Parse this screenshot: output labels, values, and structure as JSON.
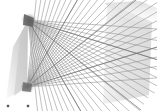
{
  "figure": {
    "kind": "line-art-geometric",
    "width": 157,
    "height": 111,
    "background_color": "#ffffff"
  },
  "chart_data": {
    "type": "scatter",
    "subtitle": "",
    "xlabel": "",
    "ylabel": "",
    "xlim": [
      0,
      157
    ],
    "ylim": [
      0,
      111
    ],
    "grid": false,
    "legend_position": "none",
    "tick_labels_x": [],
    "tick_labels_y": [],
    "annotations": [],
    "vertices": [
      {
        "name": "upper-vanishing-point",
        "x": 28,
        "y": 20
      },
      {
        "name": "lower-vanishing-point",
        "x": 27,
        "y": 87
      }
    ],
    "series": [
      {
        "name": "upper-fan",
        "type": "rays",
        "origin_x": 28,
        "origin_y": 20,
        "color": "#8c8c8c",
        "count": 26,
        "angles_deg": [
          4,
          9,
          13,
          17,
          21,
          24,
          27,
          30,
          33,
          36,
          39,
          42,
          45,
          48,
          51,
          54,
          57,
          60,
          63,
          66,
          69,
          72,
          75,
          78,
          81,
          84
        ],
        "length": 190
      },
      {
        "name": "lower-fan",
        "type": "rays",
        "origin_x": 27,
        "origin_y": 87,
        "color": "#8c8c8c",
        "count": 26,
        "angles_deg": [
          -4,
          -9,
          -13,
          -17,
          -21,
          -24,
          -27,
          -30,
          -33,
          -36,
          -39,
          -42,
          -45,
          -48,
          -51,
          -54,
          -57,
          -60,
          -63,
          -66,
          -69,
          -72,
          -75,
          -78,
          -81,
          -84
        ],
        "length": 190
      },
      {
        "name": "panel",
        "type": "polygon",
        "fill": "#e2e2e2",
        "points": [
          [
            107,
            2
          ],
          [
            152,
            22
          ],
          [
            149,
            95
          ],
          [
            103,
            104
          ]
        ]
      },
      {
        "name": "left-wedge",
        "type": "polygon",
        "fill": "#d8d8d8",
        "points": [
          [
            28,
            20
          ],
          [
            27,
            87
          ],
          [
            6,
            99
          ],
          [
            13,
            47
          ]
        ]
      },
      {
        "name": "bottom-markers",
        "type": "points",
        "color": "#5a5a5a",
        "x": [
          8,
          28
        ],
        "y": [
          106,
          106
        ]
      }
    ],
    "values": [
      20,
      87
    ],
    "categories": [
      "upper-vanishing-point",
      "lower-vanishing-point"
    ]
  },
  "colors": {
    "line": "#8c8c8c",
    "line_dark": "#6e6e6e",
    "panel": "#e2e2e2",
    "wedge": "#d8d8d8",
    "marker": "#5a5a5a",
    "background": "#ffffff"
  },
  "labels": {
    "figure_caption": "",
    "marker_left": "",
    "marker_right": ""
  }
}
